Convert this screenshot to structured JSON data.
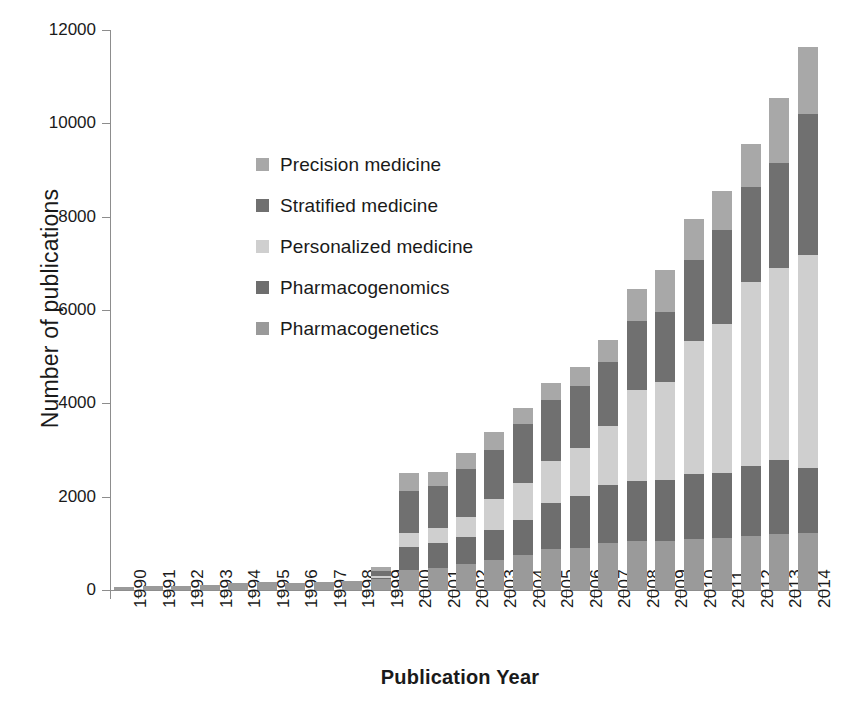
{
  "chart_data": {
    "type": "bar",
    "subtype": "stacked",
    "title": "",
    "xlabel": "Publication Year",
    "ylabel": "Number of publications",
    "ylim": [
      0,
      12000
    ],
    "ytick_values": [
      0,
      2000,
      4000,
      6000,
      8000,
      10000,
      12000
    ],
    "ytick_labels": [
      "0",
      "2000",
      "4000",
      "6000",
      "8000",
      "10000",
      "12000"
    ],
    "grid": false,
    "legend_position": "inside-upper-left",
    "categories": [
      "1990",
      "1991",
      "1992",
      "1993",
      "1994",
      "1995",
      "1996",
      "1997",
      "1998",
      "1999",
      "2000",
      "2001",
      "2002",
      "2003",
      "2004",
      "2005",
      "2006",
      "2007",
      "2008",
      "2009",
      "2010",
      "2011",
      "2012",
      "2013",
      "2014"
    ],
    "stack_order_bottom_to_top": [
      "Pharmacogenetics",
      "Pharmacogenomics",
      "Personalized medicine",
      "Stratified medicine",
      "Precision medicine"
    ],
    "series": [
      {
        "name": "Pharmacogenetics",
        "color": "#9a9a9a",
        "values": [
          70,
          80,
          85,
          110,
          140,
          175,
          150,
          170,
          185,
          230,
          430,
          480,
          560,
          640,
          760,
          870,
          900,
          1000,
          1040,
          1060,
          1090,
          1110,
          1150,
          1200,
          1230
        ]
      },
      {
        "name": "Pharmacogenomics",
        "color": "#6e6e6e",
        "values": [
          0,
          0,
          0,
          0,
          0,
          0,
          0,
          0,
          0,
          20,
          500,
          520,
          570,
          640,
          740,
          1000,
          1120,
          1260,
          1300,
          1290,
          1390,
          1400,
          1500,
          1590,
          1390
        ]
      },
      {
        "name": "Personalized medicine",
        "color": "#cfcfcf",
        "values": [
          0,
          0,
          0,
          0,
          0,
          0,
          0,
          0,
          0,
          60,
          300,
          320,
          430,
          670,
          800,
          900,
          1030,
          1250,
          1950,
          2100,
          2860,
          3180,
          3950,
          4100,
          4560
        ]
      },
      {
        "name": "Stratified medicine",
        "color": "#707070",
        "values": [
          0,
          0,
          0,
          0,
          0,
          0,
          0,
          0,
          0,
          90,
          900,
          920,
          1030,
          1060,
          1260,
          1310,
          1330,
          1380,
          1470,
          1500,
          1740,
          2030,
          2030,
          2250,
          3020
        ]
      },
      {
        "name": "Precision medicine",
        "color": "#a8a8a8",
        "values": [
          0,
          0,
          0,
          0,
          0,
          0,
          0,
          0,
          0,
          90,
          370,
          300,
          350,
          380,
          350,
          350,
          400,
          460,
          700,
          900,
          870,
          830,
          930,
          1400,
          1440
        ]
      }
    ],
    "totals": [
      70,
      80,
      85,
      110,
      140,
      175,
      150,
      170,
      185,
      490,
      2500,
      2540,
      2940,
      3390,
      3910,
      4430,
      4780,
      5350,
      6460,
      6850,
      7950,
      8550,
      9560,
      10540,
      11640
    ]
  },
  "legend": {
    "items": [
      {
        "label": "Precision medicine",
        "color": "#a8a8a8"
      },
      {
        "label": "Stratified medicine",
        "color": "#707070"
      },
      {
        "label": "Personalized medicine",
        "color": "#cfcfcf"
      },
      {
        "label": "Pharmacogenomics",
        "color": "#6e6e6e"
      },
      {
        "label": "Pharmacogenetics",
        "color": "#9a9a9a"
      }
    ]
  },
  "axes": {
    "y_title": "Number of publications",
    "x_title": "Publication Year"
  },
  "colors": {
    "axis": "#8d8d8d",
    "text": "#1a1a1a",
    "background": "#ffffff"
  }
}
